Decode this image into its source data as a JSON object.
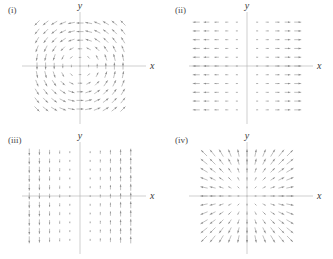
{
  "figure": {
    "background_color": "#ffffff",
    "axis_color": "#b0b0b0",
    "arrow_color": "#8a8a8a",
    "text_color": "#3a3a3a",
    "columns": 2,
    "rows": 2
  },
  "axis_labels": {
    "x": "x",
    "y": "y"
  },
  "panels": [
    {
      "id": "panel-i",
      "label": "(i)",
      "x_axis_label": "x",
      "y_axis_label": "y",
      "field_type": "rotational",
      "description": "Counterclockwise circulation about the origin",
      "formula": "F = (-y, x)",
      "grid_columns": 11,
      "grid_rows": 11,
      "arrow_color": "#8a8a8a"
    },
    {
      "id": "panel-ii",
      "label": "(ii)",
      "x_axis_label": "x",
      "y_axis_label": "y",
      "field_type": "horizontal",
      "description": "Horizontal arrows pointing away from the y axis, magnitude grows with |x|",
      "formula": "F = (x, 0)",
      "grid_columns": 10,
      "grid_rows": 11,
      "arrow_color": "#8a8a8a"
    },
    {
      "id": "panel-iii",
      "label": "(iii)",
      "x_axis_label": "x",
      "y_axis_label": "y",
      "field_type": "vertical",
      "description": "Vertical arrows, downward for x < 0 and upward for x > 0, magnitude grows with |x|",
      "formula": "F = (0, x)",
      "grid_columns": 10,
      "grid_rows": 11,
      "arrow_color": "#8a8a8a"
    },
    {
      "id": "panel-iv",
      "label": "(iv)",
      "x_axis_label": "x",
      "y_axis_label": "y",
      "field_type": "radial",
      "description": "Radial arrows pointing outward from the origin, magnitude grows with distance",
      "formula": "F = (x, y)",
      "grid_columns": 11,
      "grid_rows": 11,
      "arrow_color": "#8a8a8a"
    }
  ],
  "chart_data": {
    "type": "scatter",
    "xlabel": "x",
    "ylabel": "y",
    "grid": false,
    "legend": "none",
    "xlim": [
      -5,
      5
    ],
    "ylim": [
      -5,
      5
    ],
    "subplots": [
      {
        "label": "(i)",
        "type": "quiver",
        "field": "rotational",
        "formula": "F(x,y) = (-y, x)",
        "x": [
          -5,
          -4,
          -3,
          -2,
          -1,
          0,
          1,
          2,
          3,
          4,
          5
        ],
        "y": [
          -5,
          -4,
          -3,
          -2,
          -1,
          0,
          1,
          2,
          3,
          4,
          5
        ],
        "u_rule": "-y",
        "v_rule": "x",
        "magnitude_scaling": "clipped square pattern; arrows shortest at origin",
        "xlabel": "x",
        "ylabel": "y"
      },
      {
        "label": "(ii)",
        "type": "quiver",
        "field": "horizontal",
        "formula": "F(x,y) = (x, 0)",
        "x": [
          -5,
          -4,
          -3,
          -2,
          -1,
          1,
          2,
          3,
          4,
          5
        ],
        "y": [
          -5,
          -4,
          -3,
          -2,
          -1,
          0,
          1,
          2,
          3,
          4,
          5
        ],
        "u_rule": "x",
        "v_rule": "0",
        "magnitude_scaling": "proportional to |x|",
        "xlabel": "x",
        "ylabel": "y"
      },
      {
        "label": "(iii)",
        "type": "quiver",
        "field": "vertical",
        "formula": "F(x,y) = (0, x)",
        "x": [
          -5,
          -4,
          -3,
          -2,
          -1,
          1,
          2,
          3,
          4,
          5
        ],
        "y": [
          -5,
          -4,
          -3,
          -2,
          -1,
          0,
          1,
          2,
          3,
          4,
          5
        ],
        "u_rule": "0",
        "v_rule": "x",
        "magnitude_scaling": "proportional to |x|",
        "xlabel": "x",
        "ylabel": "y"
      },
      {
        "label": "(iv)",
        "type": "quiver",
        "field": "radial",
        "formula": "F(x,y) = (x, y)",
        "x": [
          -5,
          -4,
          -3,
          -2,
          -1,
          0,
          1,
          2,
          3,
          4,
          5
        ],
        "y": [
          -5,
          -4,
          -3,
          -2,
          -1,
          0,
          1,
          2,
          3,
          4,
          5
        ],
        "u_rule": "x",
        "v_rule": "y",
        "magnitude_scaling": "proportional to distance from origin",
        "xlabel": "x",
        "ylabel": "y"
      }
    ]
  }
}
